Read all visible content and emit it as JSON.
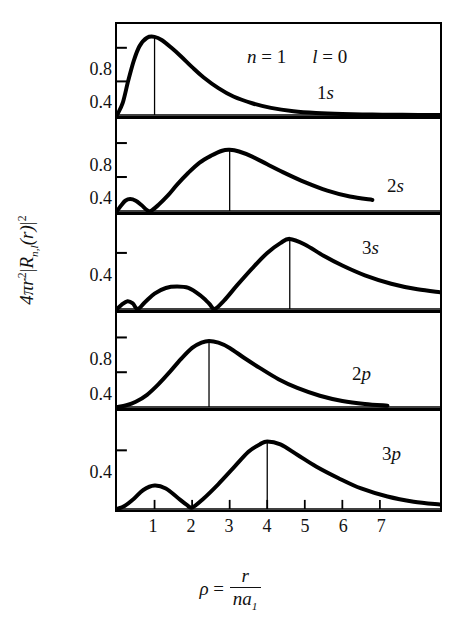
{
  "figure": {
    "y_axis_caption_parts": {
      "coef": "4π",
      "r_sym": "r",
      "r_exp": "2",
      "bar_left": "|",
      "R_sym": "R",
      "R_sub": "n,l",
      "arg": "(r)",
      "bar_right": "|",
      "outer_exp": "2"
    },
    "x_axis_caption_parts": {
      "rho": "ρ",
      "equals": "=",
      "numerator": "r",
      "denominator": "na",
      "denominator_sub": "1"
    },
    "x_tick_labels": [
      "1",
      "2",
      "3",
      "4",
      "5",
      "6",
      "7"
    ],
    "annotations": {
      "n_label": "n = 1",
      "l_label": "l = 0"
    }
  },
  "chart_data": {
    "type": "line",
    "title": "",
    "xlabel": "ρ = r/na₁",
    "ylabel": "4πr²|Rₙ,ₗ(r)|²",
    "xlim": [
      0,
      8.6
    ],
    "grid": false,
    "legend": "in-panel labels",
    "shared_x_ticks": [
      1,
      2,
      3,
      4,
      5,
      6,
      7
    ],
    "panels": [
      {
        "orbital": "1s",
        "n": 1,
        "l": 0,
        "y_ticks": [
          0.4,
          0.8
        ],
        "ylim": [
          0,
          1.0
        ],
        "peak_rho": 1.0,
        "peak_value": 0.93,
        "x": [
          0.0,
          0.15,
          0.3,
          0.45,
          0.6,
          0.8,
          1.0,
          1.2,
          1.45,
          1.7,
          2.0,
          2.3,
          2.7,
          3.1,
          3.6,
          4.1,
          4.7,
          5.3,
          6.0,
          6.8,
          7.6,
          8.6
        ],
        "y": [
          0.0,
          0.14,
          0.41,
          0.65,
          0.82,
          0.92,
          0.93,
          0.89,
          0.8,
          0.7,
          0.57,
          0.45,
          0.32,
          0.22,
          0.14,
          0.085,
          0.046,
          0.025,
          0.012,
          0.005,
          0.002,
          0.001
        ]
      },
      {
        "orbital": "2s",
        "n": 2,
        "l": 0,
        "y_ticks": [
          0.4,
          0.8
        ],
        "ylim": [
          0,
          1.0
        ],
        "peak_rho": 3.0,
        "peak_value": 0.72,
        "node_rho": 0.85,
        "first_bump_rho": 0.35,
        "first_bump_value": 0.14,
        "x": [
          0.0,
          0.12,
          0.22,
          0.35,
          0.5,
          0.65,
          0.8,
          0.9,
          1.1,
          1.35,
          1.6,
          1.9,
          2.2,
          2.5,
          2.8,
          3.0,
          3.25,
          3.6,
          4.0,
          4.5,
          5.0,
          5.6,
          6.2,
          6.8
        ],
        "y": [
          0.0,
          0.07,
          0.12,
          0.14,
          0.12,
          0.07,
          0.01,
          0.0,
          0.07,
          0.18,
          0.31,
          0.45,
          0.57,
          0.65,
          0.71,
          0.72,
          0.7,
          0.64,
          0.55,
          0.44,
          0.34,
          0.24,
          0.17,
          0.13
        ]
      },
      {
        "orbital": "3s",
        "n": 3,
        "l": 0,
        "y_ticks": [
          0.4
        ],
        "ylim": [
          0,
          0.62
        ],
        "peak_rho": 4.6,
        "peak_value": 0.5,
        "node_rho_1": 0.55,
        "node_rho_2": 2.6,
        "bump1_rho": 0.28,
        "bump1_value": 0.055,
        "bump2_rho": 1.6,
        "bump2_value": 0.16,
        "x": [
          0.0,
          0.12,
          0.28,
          0.42,
          0.55,
          0.75,
          1.0,
          1.3,
          1.6,
          1.9,
          2.2,
          2.45,
          2.6,
          2.85,
          3.2,
          3.6,
          4.0,
          4.35,
          4.6,
          5.0,
          5.5,
          6.0,
          6.6,
          7.3,
          8.0,
          8.6
        ],
        "y": [
          0.0,
          0.03,
          0.055,
          0.04,
          0.0,
          0.05,
          0.11,
          0.15,
          0.16,
          0.15,
          0.1,
          0.04,
          0.0,
          0.06,
          0.17,
          0.29,
          0.4,
          0.47,
          0.5,
          0.46,
          0.38,
          0.31,
          0.24,
          0.18,
          0.14,
          0.12
        ]
      },
      {
        "orbital": "2p",
        "n": 2,
        "l": 1,
        "y_ticks": [
          0.4,
          0.8
        ],
        "ylim": [
          0,
          1.0
        ],
        "peak_rho": 2.45,
        "peak_value": 0.76,
        "x": [
          0.0,
          0.25,
          0.5,
          0.8,
          1.1,
          1.4,
          1.7,
          2.0,
          2.25,
          2.45,
          2.7,
          3.0,
          3.4,
          3.8,
          4.3,
          4.8,
          5.4,
          6.0,
          6.6,
          7.2
        ],
        "y": [
          0.0,
          0.02,
          0.06,
          0.14,
          0.26,
          0.4,
          0.55,
          0.68,
          0.74,
          0.76,
          0.74,
          0.68,
          0.56,
          0.45,
          0.32,
          0.22,
          0.13,
          0.07,
          0.035,
          0.015
        ]
      },
      {
        "orbital": "3p",
        "n": 3,
        "l": 1,
        "y_ticks": [
          0.4
        ],
        "ylim": [
          0,
          0.62
        ],
        "peak_rho": 4.0,
        "peak_value": 0.46,
        "node_rho": 2.0,
        "first_bump_rho": 1.0,
        "first_bump_value": 0.16,
        "x": [
          0.0,
          0.2,
          0.45,
          0.7,
          1.0,
          1.3,
          1.6,
          1.85,
          2.0,
          2.3,
          2.7,
          3.1,
          3.5,
          3.8,
          4.0,
          4.35,
          4.8,
          5.3,
          5.9,
          6.5,
          7.2,
          7.9,
          8.6
        ],
        "y": [
          0.0,
          0.02,
          0.07,
          0.13,
          0.16,
          0.14,
          0.08,
          0.03,
          0.01,
          0.07,
          0.17,
          0.28,
          0.39,
          0.44,
          0.46,
          0.44,
          0.37,
          0.29,
          0.21,
          0.14,
          0.085,
          0.05,
          0.03
        ]
      }
    ]
  }
}
